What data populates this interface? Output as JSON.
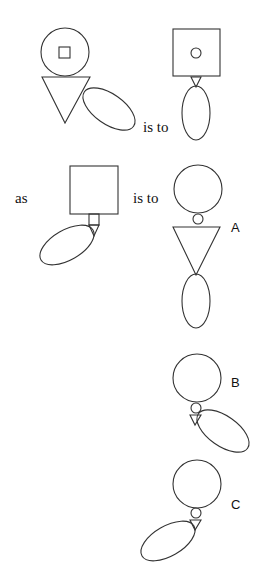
{
  "puzzle": {
    "connector_1": "is to",
    "connector_2": "as",
    "connector_3": "is to",
    "options": [
      {
        "label": "A"
      },
      {
        "label": "B"
      },
      {
        "label": "C"
      }
    ]
  },
  "figures": [
    {
      "name": "figure-1",
      "parts": [
        "large-circle-with-inner-square",
        "downward-triangle",
        "ellipse-tilted-right-down"
      ]
    },
    {
      "name": "figure-2",
      "parts": [
        "large-square-with-inner-circle",
        "small-downward-triangle",
        "vertical-ellipse"
      ]
    },
    {
      "name": "figure-3",
      "parts": [
        "large-square",
        "small-square",
        "small-downward-triangle",
        "ellipse-tilted-left-down"
      ]
    },
    {
      "name": "option-a",
      "parts": [
        "large-circle",
        "small-circle",
        "large-downward-triangle",
        "vertical-ellipse"
      ]
    },
    {
      "name": "option-b",
      "parts": [
        "large-circle",
        "small-circle",
        "small-downward-triangle",
        "ellipse-tilted-right-down"
      ]
    },
    {
      "name": "option-c",
      "parts": [
        "large-circle",
        "small-circle",
        "small-downward-triangle",
        "ellipse-tilted-left-down"
      ]
    }
  ],
  "colors": {
    "stroke": "#333333",
    "background": "#ffffff",
    "text": "#111111"
  }
}
